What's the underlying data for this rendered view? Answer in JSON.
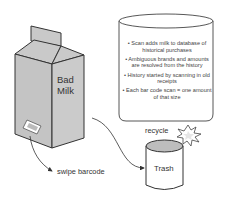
{
  "diagram": {
    "carton": {
      "label_line1": "Bad",
      "label_line2": "Milk",
      "fill": "#c9c9c9",
      "stroke": "#333333"
    },
    "database": {
      "bullets": [
        "• Scan adds milk to database of historical purchases",
        "• Ambiguous brands and amounts are resolved from the history",
        "• History started by scanning in old receipts",
        "• Each bar code scan = one amount of that size"
      ]
    },
    "actions": {
      "swipe_label": "swipe barcode",
      "recycle_label": "recycle"
    },
    "trash": {
      "label": "Trash",
      "lid_fill": "#bdbdbd"
    }
  }
}
